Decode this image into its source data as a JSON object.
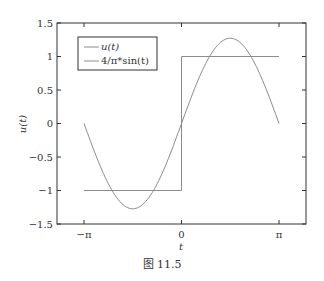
{
  "caption": "图 11.5",
  "chart_data": {
    "type": "line",
    "title": "",
    "xlabel": "t",
    "ylabel": "u(t)",
    "xlim": [
      -3.14159,
      3.14159
    ],
    "ylim": [
      -1.5,
      1.5
    ],
    "grid": false,
    "legend_position": "upper left",
    "x_ticks": [
      {
        "value": -3.14159,
        "label": "−π"
      },
      {
        "value": 0,
        "label": "0"
      },
      {
        "value": 3.14159,
        "label": "π"
      }
    ],
    "y_ticks": [
      {
        "value": 1.5,
        "label": "1.5"
      },
      {
        "value": 1,
        "label": "1"
      },
      {
        "value": 0.5,
        "label": "0.5"
      },
      {
        "value": 0,
        "label": "0"
      },
      {
        "value": -0.5,
        "label": "−0.5"
      },
      {
        "value": -1,
        "label": "−1"
      },
      {
        "value": -1.5,
        "label": "−1.5"
      }
    ],
    "series": [
      {
        "name": "u(t)",
        "kind": "step",
        "color": "#8c8c8c",
        "x": [
          -3.14159,
          0,
          0,
          3.14159
        ],
        "values": [
          -1,
          -1,
          1,
          1
        ]
      },
      {
        "name": "4/π*sin(t)",
        "kind": "function",
        "color": "#8c8c8c",
        "x": [
          -3.14159,
          -2.3562,
          -1.5708,
          -0.7854,
          0,
          0.7854,
          1.5708,
          2.3562,
          3.14159
        ],
        "values": [
          0,
          -0.9003,
          -1.2732,
          -0.9003,
          0,
          0.9003,
          1.2732,
          0.9003,
          0
        ]
      }
    ]
  },
  "colors": {
    "frame": "#333333",
    "line": "#8c8c8c"
  }
}
